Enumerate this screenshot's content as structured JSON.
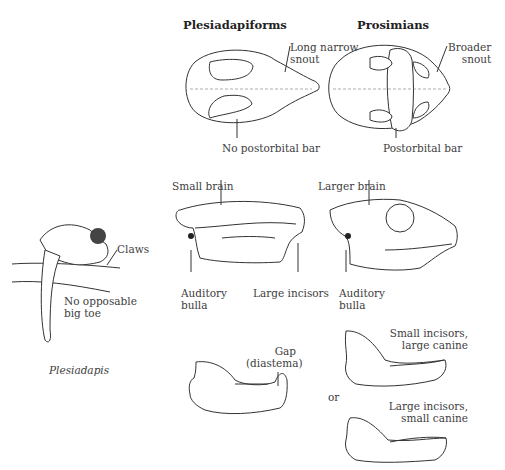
{
  "headers": {
    "left": "Plesiadapiforms",
    "right": "Prosimians"
  },
  "top_view": {
    "left_snout_label": [
      "Long narrow",
      "snout"
    ],
    "left_bar_label": "No postorbital bar",
    "right_snout_label": [
      "Broader",
      "snout"
    ],
    "right_bar_label": "Postorbital bar"
  },
  "side_view": {
    "left_brain_label": "Small brain",
    "left_bulla_label": [
      "Auditory",
      "bulla"
    ],
    "left_incisor_label": "Large incisors",
    "right_brain_label": "Larger brain",
    "right_bulla_label": [
      "Auditory",
      "bulla"
    ]
  },
  "animal": {
    "claws_label": "Claws",
    "toe_label": [
      "No opposable",
      "big toe"
    ],
    "caption": "Plesiadapis"
  },
  "jaws": {
    "left_gap_label": [
      "Gap",
      "(diastema)"
    ],
    "or_label": "or",
    "right_top_label": [
      "Small incisors,",
      "large canine"
    ],
    "right_bottom_label": [
      "Large incisors,",
      "small canine"
    ]
  }
}
